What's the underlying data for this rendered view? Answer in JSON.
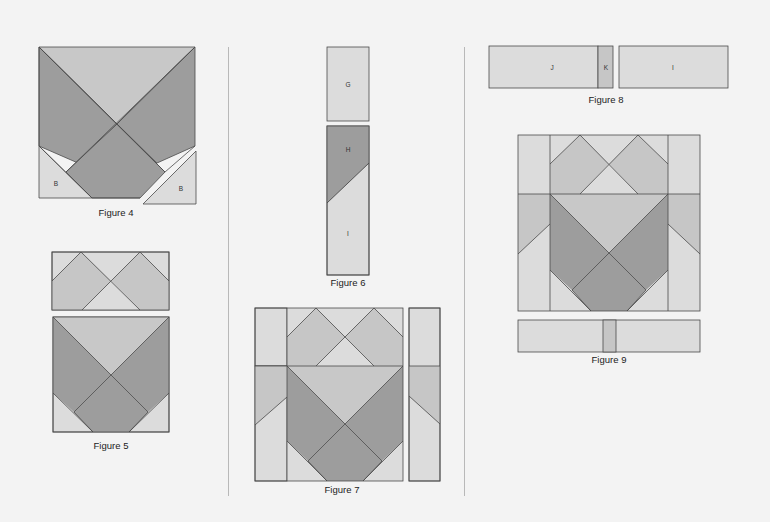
{
  "page": {
    "background": "#f3f3f3",
    "colors": {
      "light": "#dcdcdc",
      "medium": "#c6c6c6",
      "dark": "#9d9d9d",
      "lighter": "#e2e2e2",
      "stroke": "#4a4a4a"
    }
  },
  "dividers": [
    {
      "x": 228,
      "y1": 47,
      "y2": 496
    },
    {
      "x": 464,
      "y1": 47,
      "y2": 496
    }
  ],
  "figures": [
    {
      "id": "figure-4",
      "caption": "Figure 4",
      "caption_pos": {
        "x": 116,
        "y": 207
      },
      "labels": [
        {
          "text": "B",
          "x": 56,
          "y": 183
        },
        {
          "text": "B",
          "x": 181,
          "y": 188
        }
      ]
    },
    {
      "id": "figure-5",
      "caption": "Figure 5",
      "caption_pos": {
        "x": 111,
        "y": 440
      },
      "labels": []
    },
    {
      "id": "figure-6",
      "caption": "Figure 6",
      "caption_pos": {
        "x": 348,
        "y": 277
      },
      "labels": [
        {
          "text": "G",
          "x": 348,
          "y": 84
        },
        {
          "text": "H",
          "x": 348,
          "y": 149
        },
        {
          "text": "I",
          "x": 348,
          "y": 233
        }
      ]
    },
    {
      "id": "figure-7",
      "caption": "Figure 7",
      "caption_pos": {
        "x": 342,
        "y": 485
      },
      "labels": []
    },
    {
      "id": "figure-8",
      "caption": "Figure 8",
      "caption_pos": {
        "x": 606,
        "y": 95
      },
      "labels": [
        {
          "text": "J",
          "x": 552,
          "y": 67
        },
        {
          "text": "K",
          "x": 606,
          "y": 67
        },
        {
          "text": "I",
          "x": 673,
          "y": 67
        }
      ]
    },
    {
      "id": "figure-9",
      "caption": "Figure 9",
      "caption_pos": {
        "x": 609,
        "y": 355
      },
      "labels": []
    }
  ]
}
